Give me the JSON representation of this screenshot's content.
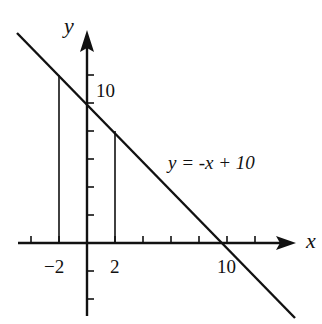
{
  "diagram": {
    "type": "coordinate-plane-line-graph",
    "equation_label": "y = -x + 10",
    "axes": {
      "x_label": "x",
      "y_label": "y"
    },
    "tick_labels": {
      "x_neg2": "−2",
      "x_2": "2",
      "x_10": "10",
      "y_10": "10"
    },
    "line": {
      "slope": -1,
      "intercept": 10
    },
    "vertical_segments_at_x": [
      -2,
      2
    ],
    "colors": {
      "ink": "#111111",
      "background": "#ffffff"
    }
  }
}
